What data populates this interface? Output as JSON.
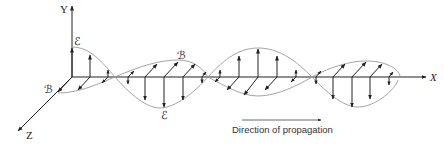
{
  "diagram": {
    "axes": {
      "y_label": "Y",
      "x_label": "X",
      "z_label": "Z"
    },
    "field_labels": {
      "electric_top": "ℰ",
      "magnetic_left": "ℬ",
      "magnetic_top": "ℬ",
      "electric_bottom": "ℰ"
    },
    "propagation_label": "Direction of propagation",
    "colors": {
      "axis": "#222222",
      "envelope": "#9a9a9a",
      "arrow": "#222222"
    }
  }
}
